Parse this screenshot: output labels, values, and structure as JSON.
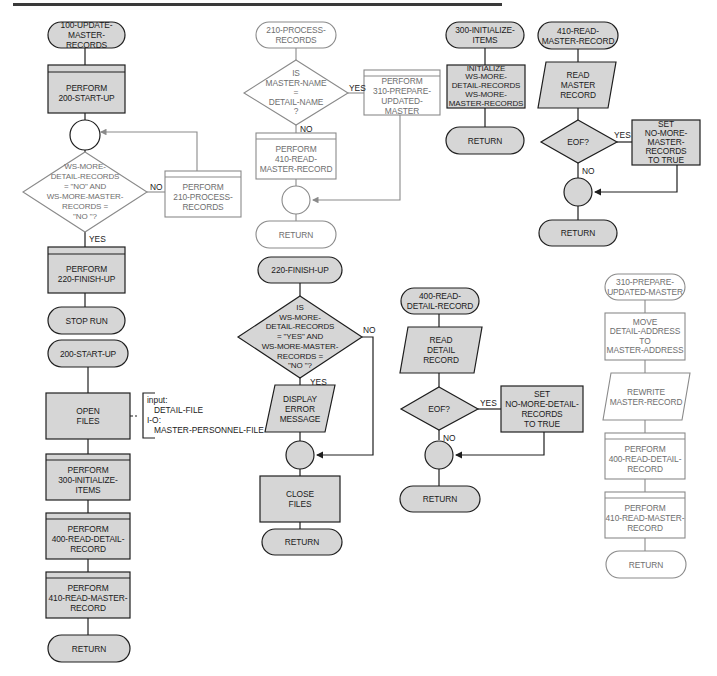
{
  "page": {
    "header_rule": true
  },
  "colors": {
    "shaded_fill": "#d6d6d6",
    "shaded_header": "#c4c4c4",
    "dark_stroke": "#1e1e1e",
    "light_stroke": "#8a8a8a",
    "light_text": "#6e6e6e",
    "dark_text": "#1a1a1a"
  },
  "main": {
    "start": "100-UPDATE-\nMASTER-RECORDS",
    "perform_startup": "PERFORM\n200-START-UP",
    "decision": "WS-MORE-\nDETAIL-RECORDS\n= \"NO\" AND\nWS-MORE-MASTER-\nRECORDS =\n\"NO \"?",
    "no_label": "NO",
    "yes_label": "YES",
    "perform_process": "PERFORM\n210-PROCESS-\nRECORDS",
    "perform_finish": "PERFORM\n220-FINISH-UP",
    "stop": "STOP RUN"
  },
  "startup": {
    "start": "200-START-UP",
    "open_files": "OPEN\nFILES",
    "annotation": "input:\n   DETAIL-FILE\nI-O:\n   MASTER-PERSONNEL-FILE",
    "perform_init": "PERFORM\n300-INITIALIZE-\nITEMS",
    "perform_read_detail": "PERFORM\n400-READ-DETAIL-\nRECORD",
    "perform_read_master": "PERFORM\n410-READ-MASTER-\nRECORD",
    "return": "RETURN"
  },
  "process": {
    "start": "210-PROCESS-\nRECORDS",
    "decision": "IS\nMASTER-NAME\n=\nDETAIL-NAME\n?",
    "yes_label": "YES",
    "no_label": "NO",
    "perform_prepare": "PERFORM\n310-PREPARE-\nUPDATED-\nMASTER",
    "perform_read_master": "PERFORM\n410-READ-\nMASTER-RECORD",
    "return": "RETURN"
  },
  "finish": {
    "start": "220-FINISH-UP",
    "decision": "IS\nWS-MORE-\nDETAIL-RECORDS\n= \"YES\" AND\nWS-MORE-MASTER-\nRECORDS =\n\"NO \"?",
    "yes_label": "YES",
    "no_label": "NO",
    "display": "DISPLAY\nERROR\nMESSAGE",
    "close": "CLOSE\nFILES",
    "return": "RETURN"
  },
  "init": {
    "start": "300-INITIALIZE-\nITEMS",
    "initialize": "INITIALIZE\nWS-MORE-\nDETAIL-RECORDS\nWS-MORE-\nMASTER-RECORDS",
    "return": "RETURN"
  },
  "read_master": {
    "start": "410-READ-\nMASTER-RECORD",
    "read": "READ\nMASTER\nRECORD",
    "decision": "EOF?",
    "yes_label": "YES",
    "no_label": "NO",
    "set": "SET\nNO-MORE-\nMASTER-\nRECORDS\nTO TRUE",
    "return": "RETURN"
  },
  "read_detail": {
    "start": "400-READ-\nDETAIL-RECORD",
    "read": "READ\nDETAIL\nRECORD",
    "decision": "EOF?",
    "yes_label": "YES",
    "no_label": "NO",
    "set": "SET\nNO-MORE-DETAIL-\nRECORDS\nTO TRUE",
    "return": "RETURN"
  },
  "prepare": {
    "start": "310-PREPARE-\nUPDATED-MASTER",
    "move": "MOVE\nDETAIL-ADDRESS\nTO\nMASTER-ADDRESS",
    "rewrite": "REWRITE\nMASTER-RECORD",
    "perform_read_detail": "PERFORM\n400-READ-DETAIL-\nRECORD",
    "perform_read_master": "PERFORM\n410-READ-MASTER-\nRECORD",
    "return": "RETURN"
  }
}
